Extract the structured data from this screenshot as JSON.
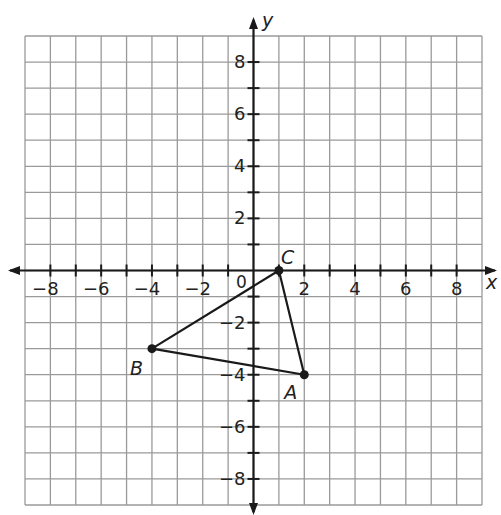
{
  "chart_data": {
    "type": "scatter",
    "title": "",
    "xlabel": "x",
    "ylabel": "y",
    "xlim": [
      -9,
      9
    ],
    "ylim": [
      -9,
      9
    ],
    "grid": true,
    "x_ticks": [
      -8,
      -6,
      -4,
      -2,
      2,
      4,
      6,
      8
    ],
    "y_ticks": [
      -8,
      -6,
      -4,
      -2,
      2,
      4,
      6,
      8
    ],
    "origin_label": "0",
    "points": [
      {
        "label": "A",
        "x": 2,
        "y": -4
      },
      {
        "label": "B",
        "x": -4,
        "y": -3
      },
      {
        "label": "C",
        "x": 1,
        "y": 0
      }
    ],
    "polygon": [
      "A",
      "B",
      "C"
    ]
  },
  "colors": {
    "grid": "#9a9a9a",
    "axis": "#1a1a1a",
    "shape": "#1a1a1a"
  }
}
